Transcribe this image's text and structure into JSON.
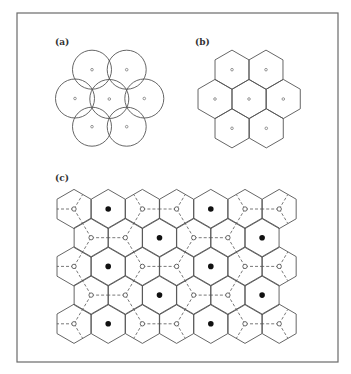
{
  "panels": {
    "a": {
      "label": "(a)",
      "label_pos": [
        55,
        45
      ],
      "shape": "circle",
      "radius": 19.5,
      "centers": [
        [
          92,
          69.7
        ],
        [
          126.7,
          69.7
        ],
        [
          75,
          98.5
        ],
        [
          109.3,
          99
        ],
        [
          144.3,
          98.5
        ],
        [
          92,
          126.7
        ],
        [
          126.7,
          126.7
        ]
      ]
    },
    "b": {
      "label": "(b)",
      "label_pos": [
        195,
        45
      ],
      "shape": "hexagon-pointy-top",
      "radius": 19.6,
      "centers": [
        [
          232,
          69.7
        ],
        [
          266,
          69.7
        ],
        [
          215,
          99
        ],
        [
          249,
          99
        ],
        [
          283.3,
          99
        ],
        [
          232,
          128.3
        ],
        [
          266.3,
          128.3
        ]
      ]
    },
    "c": {
      "label": "(c)",
      "label_pos": [
        55,
        181
      ],
      "shape": "hexagon-pointy-top",
      "radius": 19.6,
      "rows": 5,
      "row_y0": 209,
      "row_dy": 28.7,
      "even_row_x0": 74,
      "odd_row_x0": 91.1,
      "dx": 34.2,
      "even_row_count": 7,
      "odd_row_count": 6,
      "site_legend": {
        "black": "filled dot (cell center, every third cell)",
        "open": "open circle (linked by dashed lines)"
      }
    }
  },
  "frame": {
    "x": 17,
    "y": 13,
    "width": 321,
    "height": 349
  },
  "colors": {
    "line": "#555555",
    "frame": "#6a6a6a",
    "fill_black": "#111111",
    "background": "#ffffff"
  }
}
